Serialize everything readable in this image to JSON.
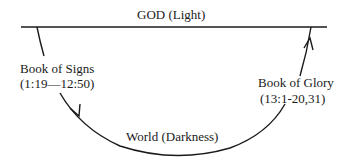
{
  "diagram": {
    "top_label": "GOD (Light)",
    "bottom_label": "World (Darkness)",
    "left_label": {
      "title": "Book of Signs",
      "range": "(1:19—12:50)"
    },
    "right_label": {
      "title": "Book of Glory",
      "range": "(13:1-20,31)"
    },
    "line_color": "#1a1a1a"
  }
}
